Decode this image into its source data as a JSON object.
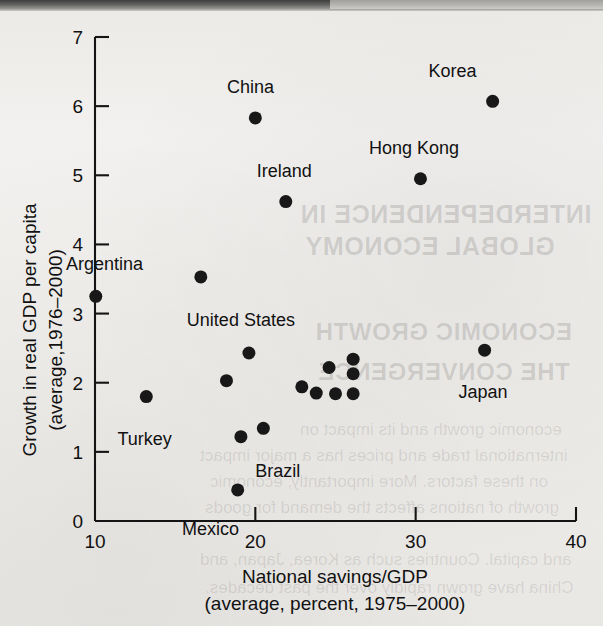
{
  "figure": {
    "kind": "scatter-plot-figure",
    "background_note": "scanned textbook page"
  },
  "ghost_text": {
    "line1": "INTERDEPENDENCE IN",
    "line2": "GLOBAL ECONOMY",
    "line3": "ECONOMIC GROWTH",
    "line4": "THE CONVERGENCE",
    "body1": "economic growth and its impact on",
    "body2": "international trade and prices has a major impact",
    "body3": "on these factors. More importantly, economic",
    "body4": "growth of nations affects the demand for goods",
    "body5": "and capital. Countries such as Korea, Japan, and",
    "body6": "China have grown rapidly over the past decades."
  },
  "chart_data": {
    "type": "scatter",
    "title": "",
    "xlabel": "National savings/GDP",
    "xlabel2": "(average, percent, 1975–2000)",
    "ylabel": "Growth in real GDP per capita",
    "ylabel2": "(average,1976–2000)",
    "xlim": [
      10,
      40
    ],
    "ylim": [
      0,
      7
    ],
    "xticks": [
      10,
      20,
      30,
      40
    ],
    "xtick_labels": [
      "10",
      "20",
      "30",
      "40"
    ],
    "yticks": [
      0,
      1,
      2,
      3,
      4,
      5,
      6,
      7
    ],
    "ytick_labels": [
      "0",
      "1",
      "2",
      "3",
      "4",
      "5",
      "6",
      "7"
    ],
    "grid": false,
    "legend": false,
    "marker_color": "#181818",
    "marker_size": 8,
    "points": [
      {
        "label": "Korea",
        "x": 34.8,
        "y": 6.07,
        "label_dx": -2.5,
        "label_dy": 0.44,
        "anchor": "middle"
      },
      {
        "label": "China",
        "x": 20.0,
        "y": 5.83,
        "label_dx": -0.3,
        "label_dy": 0.44,
        "anchor": "middle"
      },
      {
        "label": "Hong Kong",
        "x": 30.3,
        "y": 4.95,
        "label_dx": -0.4,
        "label_dy": 0.44,
        "anchor": "middle"
      },
      {
        "label": "Ireland",
        "x": 21.9,
        "y": 4.62,
        "label_dx": -0.1,
        "label_dy": 0.44,
        "anchor": "middle"
      },
      {
        "label": "",
        "x": 16.6,
        "y": 3.53,
        "label_dx": 0,
        "label_dy": 0,
        "anchor": "middle"
      },
      {
        "label": "Argentina",
        "x": 10.05,
        "y": 3.25,
        "label_dx": 0.55,
        "label_dy": 0.46,
        "anchor": "middle"
      },
      {
        "label": "United States",
        "x": 19.6,
        "y": 2.43,
        "label_dx": -0.5,
        "label_dy": 0.48,
        "anchor": "middle"
      },
      {
        "label": "Japan",
        "x": 34.3,
        "y": 2.47,
        "label_dx": -0.1,
        "label_dy": -0.6,
        "anchor": "middle"
      },
      {
        "label": "",
        "x": 18.2,
        "y": 2.03,
        "label_dx": 0,
        "label_dy": 0,
        "anchor": "middle"
      },
      {
        "label": "",
        "x": 22.9,
        "y": 1.94,
        "label_dx": 0,
        "label_dy": 0,
        "anchor": "middle"
      },
      {
        "label": "",
        "x": 24.6,
        "y": 2.22,
        "label_dx": 0,
        "label_dy": 0,
        "anchor": "middle"
      },
      {
        "label": "",
        "x": 23.8,
        "y": 1.85,
        "label_dx": 0,
        "label_dy": 0,
        "anchor": "middle"
      },
      {
        "label": "",
        "x": 25.0,
        "y": 1.84,
        "label_dx": 0,
        "label_dy": 0,
        "anchor": "middle"
      },
      {
        "label": "",
        "x": 26.1,
        "y": 2.34,
        "label_dx": 0,
        "label_dy": 0,
        "anchor": "middle"
      },
      {
        "label": "",
        "x": 26.1,
        "y": 2.13,
        "label_dx": 0,
        "label_dy": 0,
        "anchor": "middle"
      },
      {
        "label": "",
        "x": 26.1,
        "y": 1.84,
        "label_dx": 0,
        "label_dy": 0,
        "anchor": "middle"
      },
      {
        "label": "Turkey",
        "x": 13.2,
        "y": 1.8,
        "label_dx": -0.1,
        "label_dy": -0.62,
        "anchor": "middle"
      },
      {
        "label": "",
        "x": 19.1,
        "y": 1.22,
        "label_dx": 0,
        "label_dy": 0,
        "anchor": "middle"
      },
      {
        "label": "Brazil",
        "x": 20.5,
        "y": 1.34,
        "label_dx": 0.9,
        "label_dy": -0.62,
        "anchor": "middle"
      },
      {
        "label": "Mexico",
        "x": 18.9,
        "y": 0.45,
        "label_dx": -1.7,
        "label_dy": -0.56,
        "anchor": "middle"
      }
    ]
  }
}
